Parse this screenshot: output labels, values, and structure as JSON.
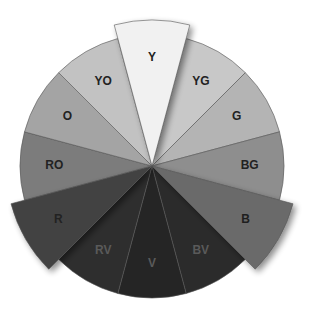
{
  "diagram": {
    "center": [
      152,
      166
    ],
    "radius": 132,
    "extended_radius": 146,
    "segments": [
      {
        "label": "Y",
        "start": 255,
        "end": 285,
        "fill": "#f1f1f1",
        "text": "#222222",
        "extended": true
      },
      {
        "label": "YG",
        "start": 285,
        "end": 315,
        "fill": "#c8c8c8",
        "text": "#222222",
        "extended": false
      },
      {
        "label": "G",
        "start": 315,
        "end": 345,
        "fill": "#b4b4b4",
        "text": "#222222",
        "extended": false
      },
      {
        "label": "BG",
        "start": 345,
        "end": 375,
        "fill": "#8e8e8e",
        "text": "#222222",
        "extended": false
      },
      {
        "label": "B",
        "start": 15,
        "end": 45,
        "fill": "#6a6a6a",
        "text": "#1e1e1e",
        "extended": true
      },
      {
        "label": "BV",
        "start": 45,
        "end": 75,
        "fill": "#2b2b2b",
        "text": "#5a5a5a",
        "extended": false
      },
      {
        "label": "V",
        "start": 75,
        "end": 105,
        "fill": "#252525",
        "text": "#5a5a5a",
        "extended": false
      },
      {
        "label": "RV",
        "start": 105,
        "end": 135,
        "fill": "#2e2e2e",
        "text": "#5a5a5a",
        "extended": false
      },
      {
        "label": "R",
        "start": 135,
        "end": 165,
        "fill": "#424242",
        "text": "#222222",
        "extended": true
      },
      {
        "label": "RO",
        "start": 165,
        "end": 195,
        "fill": "#7c7c7c",
        "text": "#222222",
        "extended": false
      },
      {
        "label": "O",
        "start": 195,
        "end": 225,
        "fill": "#a4a4a4",
        "text": "#222222",
        "extended": false
      },
      {
        "label": "YO",
        "start": 225,
        "end": 255,
        "fill": "#c2c2c2",
        "text": "#222222",
        "extended": false
      }
    ]
  }
}
